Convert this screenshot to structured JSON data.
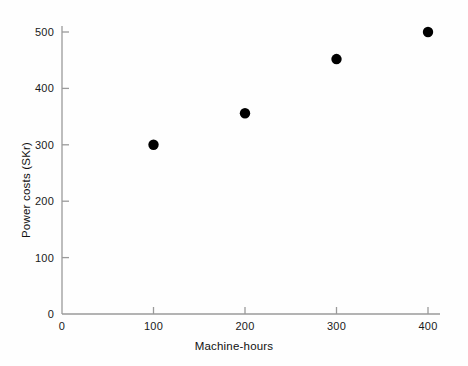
{
  "chart_data": {
    "type": "scatter",
    "title": "",
    "xlabel": "Machine-hours",
    "ylabel": "Power costs (SKr)",
    "x": [
      100,
      200,
      300,
      400
    ],
    "values": [
      300,
      356,
      452,
      500
    ],
    "points": [
      {
        "x": 100,
        "y": 300
      },
      {
        "x": 200,
        "y": 356
      },
      {
        "x": 300,
        "y": 452
      },
      {
        "x": 400,
        "y": 500
      }
    ],
    "xlim": [
      0,
      400
    ],
    "ylim": [
      0,
      500
    ],
    "xticks": [
      "0",
      "100",
      "200",
      "300",
      "400"
    ],
    "xtick_values": [
      0,
      100,
      200,
      300,
      400
    ],
    "yticks": [
      "0",
      "100",
      "200",
      "300",
      "400",
      "500"
    ],
    "ytick_values": [
      0,
      100,
      200,
      300,
      400,
      500
    ],
    "grid": false,
    "legend": null,
    "marker": "filled-circle",
    "marker_color": "#000000",
    "axis_color": "#9a9a9a",
    "background_color": "#fefefe"
  }
}
